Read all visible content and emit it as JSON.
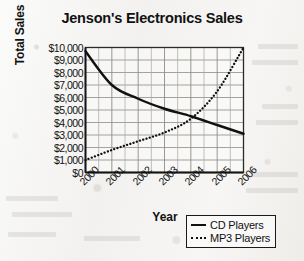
{
  "chart_data": {
    "type": "line",
    "title": "Jenson's Electronics Sales",
    "xlabel": "Year",
    "ylabel": "Total Sales",
    "categories": [
      "2000",
      "2001",
      "2002",
      "2003",
      "2004",
      "2005",
      "2006"
    ],
    "x": [
      2000,
      2001,
      2002,
      2003,
      2004,
      2005,
      2006
    ],
    "xlim": [
      2000,
      2006
    ],
    "ylim": [
      0,
      10000
    ],
    "ytick_labels": [
      "$0",
      "$1,000",
      "$2,000",
      "$3,000",
      "$4,000",
      "$5,000",
      "$6,000",
      "$7,000",
      "$8,000",
      "$9,000",
      "$10,000"
    ],
    "ytick_values": [
      0,
      1000,
      2000,
      3000,
      4000,
      5000,
      6000,
      7000,
      8000,
      9000,
      10000
    ],
    "grid": true,
    "legend_position": "bottom-right",
    "series": [
      {
        "name": "CD Players",
        "style": "solid",
        "color": "#111111",
        "values": [
          9700,
          7000,
          5900,
          5100,
          4500,
          3800,
          3100
        ]
      },
      {
        "name": "MP3 Players",
        "style": "dotted",
        "color": "#111111",
        "values": [
          1000,
          1800,
          2500,
          3200,
          4300,
          6500,
          10000
        ]
      }
    ]
  },
  "legend": {
    "items": [
      {
        "label": "CD Players",
        "style": "solid"
      },
      {
        "label": "MP3 Players",
        "style": "dotted"
      }
    ]
  }
}
